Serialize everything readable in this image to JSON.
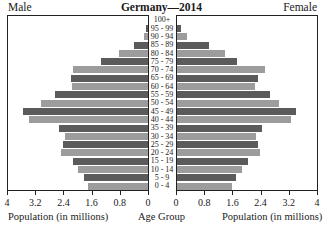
{
  "header": {
    "left_label": "Male",
    "title": "Germany—2014",
    "right_label": "Female"
  },
  "footer": {
    "left_xlabel": "Population (in millions)",
    "center_label": "Age Group",
    "right_xlabel": "Population (in millions)"
  },
  "colors": {
    "dark": "#5b5b5b",
    "light": "#9c9c9c",
    "frame": "#222222"
  },
  "chart_data": {
    "type": "bar",
    "orientation": "horizontal",
    "subtype": "population-pyramid",
    "title": "Germany—2014",
    "xlabel": "Population (in millions)",
    "ylabel": "Age Group",
    "xlim": [
      0,
      4
    ],
    "x_ticks_left": [
      "4",
      "3.2",
      "2.4",
      "1.6",
      "0.8",
      "0"
    ],
    "x_ticks_right": [
      "0",
      "0.8",
      "1.6",
      "2.4",
      "3.2",
      "4"
    ],
    "categories": [
      "100+",
      "95 - 99",
      "90 - 94",
      "85 - 89",
      "80 - 84",
      "75 - 79",
      "70 - 74",
      "65 - 69",
      "60 - 64",
      "55 - 59",
      "50 - 54",
      "45 - 49",
      "40 - 44",
      "35 - 39",
      "30 - 34",
      "25 - 29",
      "20 - 24",
      "15 - 19",
      "10 - 14",
      "5 - 9",
      "0 - 4"
    ],
    "series": [
      {
        "name": "Male",
        "side": "left",
        "values": [
          0.01,
          0.06,
          0.12,
          0.4,
          0.83,
          1.34,
          2.13,
          2.19,
          2.16,
          2.64,
          3.04,
          3.55,
          3.38,
          2.53,
          2.36,
          2.42,
          2.47,
          2.13,
          2.0,
          1.82,
          1.7
        ]
      },
      {
        "name": "Female",
        "side": "right",
        "values": [
          0.02,
          0.11,
          0.28,
          0.91,
          1.36,
          1.7,
          2.5,
          2.3,
          2.21,
          2.64,
          2.89,
          3.38,
          3.23,
          2.42,
          2.25,
          2.3,
          2.35,
          2.0,
          1.85,
          1.68,
          1.57
        ]
      }
    ],
    "legend": [
      "Male",
      "Female"
    ],
    "grid": false
  }
}
